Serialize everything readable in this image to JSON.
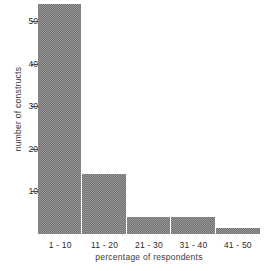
{
  "chart_data": {
    "type": "bar",
    "title": "",
    "subtitle": "",
    "xlabel": "percentage of respondents",
    "ylabel": "number of constructs",
    "categories": [
      "1 - 10",
      "11 - 20",
      "21 - 30",
      "31 - 40",
      "41 - 50"
    ],
    "values": [
      54,
      14,
      4,
      4,
      1.5
    ],
    "series": [
      {
        "name": "number of constructs",
        "values": [
          54,
          14,
          4,
          4,
          1.5
        ]
      }
    ],
    "ylim": [
      0,
      55
    ],
    "yticks": [
      10,
      20,
      30,
      40,
      50
    ],
    "ytick_labels": [
      "10",
      "20",
      "30",
      "40",
      "50"
    ],
    "grid": false,
    "legend": false,
    "legend_position": "none",
    "bar_fill": "#8a8a8a",
    "bar_pattern": "checkerboard-halftone",
    "axis_color": "#4a4a4a",
    "background": "#ffffff"
  },
  "figure": {
    "y_axis_title": "number of constructs",
    "x_axis_title": "percentage of respondents"
  }
}
